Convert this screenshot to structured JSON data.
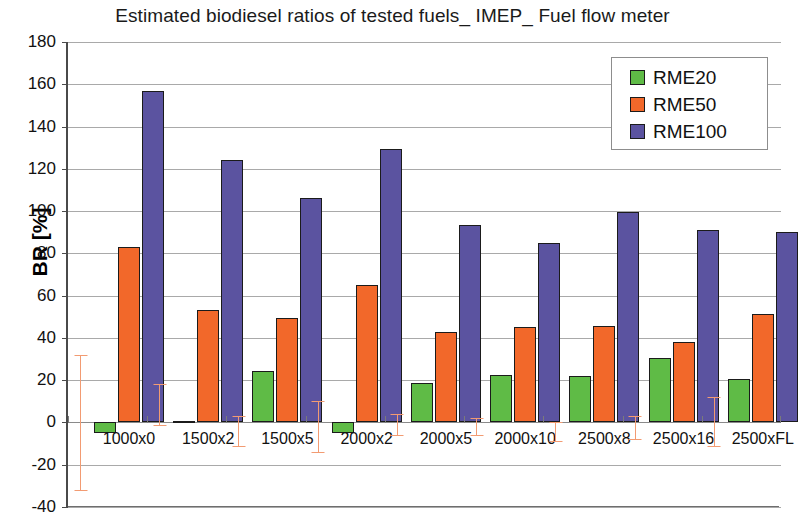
{
  "chart_data": {
    "type": "bar",
    "title": "Estimated biodiesel ratios of tested fuels_ IMEP_ Fuel flow meter",
    "xlabel": "",
    "ylabel": "BR [%]",
    "ylim": [
      -40,
      180
    ],
    "ytick_step": 20,
    "yticks": [
      180,
      160,
      140,
      120,
      100,
      80,
      60,
      40,
      20,
      0,
      -20,
      -40
    ],
    "ytick_labels": [
      "180",
      "160",
      "140",
      "120",
      "100",
      "80",
      "60",
      "40",
      "20",
      "0",
      "-20",
      "-40"
    ],
    "grid": true,
    "legend_position": "top-right",
    "categories": [
      "1000x0",
      "1500x2",
      "1500x5",
      "2000x2",
      "2000x5",
      "2000x10",
      "2500x8",
      "2500x16",
      "2500xFL"
    ],
    "series": [
      {
        "name": "RME20",
        "color": "#5fbb46",
        "values": [
          -5,
          0.5,
          24.5,
          -5,
          18.5,
          22.5,
          22,
          30.5,
          20.5
        ]
      },
      {
        "name": "RME50",
        "color": "#f2682a",
        "values": [
          83,
          53,
          49.5,
          65,
          43,
          45,
          45.5,
          38,
          51.5
        ]
      },
      {
        "name": "RME100",
        "color": "#5b53a0",
        "values": [
          157,
          124,
          106,
          129.5,
          93.5,
          85,
          99.5,
          91,
          90
        ]
      }
    ],
    "error_bars": {
      "color": "#f29b72",
      "description": "vertical whisker at left of each category group",
      "ranges": [
        {
          "category": "1000x0",
          "low": -32,
          "high": 32
        },
        {
          "category": "1500x2",
          "low": -1,
          "high": 18
        },
        {
          "category": "1500x5",
          "low": -11,
          "high": 3
        },
        {
          "category": "2000x2",
          "low": -14,
          "high": 10
        },
        {
          "category": "2000x5",
          "low": -6,
          "high": 4
        },
        {
          "category": "2000x10",
          "low": -6,
          "high": 2
        },
        {
          "category": "2500x8",
          "low": -9,
          "high": 0
        },
        {
          "category": "2500x16",
          "low": -8,
          "high": 3
        },
        {
          "category": "2500xFL",
          "low": -11,
          "high": 12
        }
      ]
    }
  },
  "legend": {
    "items": [
      {
        "label": "RME20",
        "color": "#5fbb46"
      },
      {
        "label": "RME50",
        "color": "#f2682a"
      },
      {
        "label": "RME100",
        "color": "#5b53a0"
      }
    ]
  }
}
